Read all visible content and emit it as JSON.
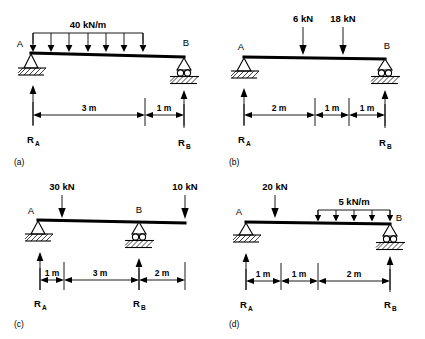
{
  "figure": {
    "background": "#ffffff",
    "ink": "#000000"
  },
  "panels": [
    {
      "id": "a",
      "caption": "(a)",
      "nodes": {
        "left": "A",
        "right": "B"
      },
      "reactions": {
        "left": "R",
        "left_sub": "A",
        "right": "R",
        "right_sub": "B"
      },
      "loads": [
        {
          "type": "udl",
          "label": "40 kN/m",
          "magnitude": 40,
          "unit": "kN/m",
          "arrows": 7,
          "start_m": 0,
          "end_m": 3
        }
      ],
      "dimensions": [
        {
          "label": "3 m",
          "value": 3,
          "unit": "m"
        },
        {
          "label": "1 m",
          "value": 1,
          "unit": "m"
        }
      ],
      "supports": {
        "left": "pin",
        "right": "roller"
      },
      "span_m": 4
    },
    {
      "id": "b",
      "caption": "(b)",
      "nodes": {
        "left": "A",
        "right": "B"
      },
      "reactions": {
        "left": "R",
        "left_sub": "A",
        "right": "R",
        "right_sub": "B"
      },
      "loads": [
        {
          "type": "point",
          "label": "6 kN",
          "magnitude": 6,
          "unit": "kN",
          "at_m": 2
        },
        {
          "type": "point",
          "label": "18 kN",
          "magnitude": 18,
          "unit": "kN",
          "at_m": 3
        }
      ],
      "dimensions": [
        {
          "label": "2 m",
          "value": 2,
          "unit": "m"
        },
        {
          "label": "1 m",
          "value": 1,
          "unit": "m"
        },
        {
          "label": "1 m",
          "value": 1,
          "unit": "m"
        }
      ],
      "supports": {
        "left": "pin",
        "right": "roller"
      },
      "span_m": 4
    },
    {
      "id": "c",
      "caption": "(c)",
      "nodes": {
        "left": "A",
        "right": "B"
      },
      "reactions": {
        "left": "R",
        "left_sub": "A",
        "right": "R",
        "right_sub": "B"
      },
      "loads": [
        {
          "type": "point",
          "label": "30 kN",
          "magnitude": 30,
          "unit": "kN",
          "at_m": 1
        },
        {
          "type": "point",
          "label": "10 kN",
          "magnitude": 10,
          "unit": "kN",
          "at_m": 6
        }
      ],
      "dimensions": [
        {
          "label": "1 m",
          "value": 1,
          "unit": "m"
        },
        {
          "label": "3 m",
          "value": 3,
          "unit": "m"
        },
        {
          "label": "2 m",
          "value": 2,
          "unit": "m"
        }
      ],
      "supports": {
        "left": "pin",
        "right": "roller"
      },
      "span_m": 6
    },
    {
      "id": "d",
      "caption": "(d)",
      "nodes": {
        "left": "A",
        "right": "B"
      },
      "reactions": {
        "left": "R",
        "left_sub": "A",
        "right": "R",
        "right_sub": "B"
      },
      "loads": [
        {
          "type": "point",
          "label": "20 kN",
          "magnitude": 20,
          "unit": "kN",
          "at_m": 1
        },
        {
          "type": "udl",
          "label": "5 kN/m",
          "magnitude": 5,
          "unit": "kN/m",
          "arrows": 5,
          "start_m": 2,
          "end_m": 4
        }
      ],
      "dimensions": [
        {
          "label": "1 m",
          "value": 1,
          "unit": "m"
        },
        {
          "label": "1 m",
          "value": 1,
          "unit": "m"
        },
        {
          "label": "2 m",
          "value": 2,
          "unit": "m"
        }
      ],
      "supports": {
        "left": "pin",
        "right": "roller"
      },
      "span_m": 4
    }
  ]
}
